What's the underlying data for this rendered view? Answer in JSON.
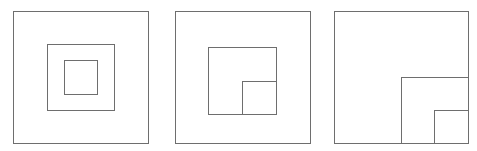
{
  "diagram": {
    "background": "#ffffff",
    "stroke_color": "#6e6e6e",
    "stroke_width": 1,
    "panels": [
      {
        "name": "concentric-squares",
        "squares": [
          {
            "name": "outer-square",
            "x": 13.5,
            "y": 11.5,
            "w": 135,
            "h": 132
          },
          {
            "name": "middle-square",
            "x": 47.5,
            "y": 44.5,
            "w": 67,
            "h": 66
          },
          {
            "name": "inner-square",
            "x": 64.5,
            "y": 60.5,
            "w": 33,
            "h": 34
          }
        ]
      },
      {
        "name": "nested-corner-in-center",
        "squares": [
          {
            "name": "outer-square",
            "x": 175.5,
            "y": 11.5,
            "w": 135,
            "h": 132
          },
          {
            "name": "middle-square",
            "x": 208.5,
            "y": 47.5,
            "w": 68,
            "h": 67
          },
          {
            "name": "inner-square",
            "x": 242.5,
            "y": 81.5,
            "w": 34,
            "h": 33
          }
        ]
      },
      {
        "name": "nested-corner-bottom-right",
        "squares": [
          {
            "name": "outer-square",
            "x": 334.5,
            "y": 11.5,
            "w": 134,
            "h": 132
          },
          {
            "name": "middle-square",
            "x": 401.5,
            "y": 77.5,
            "w": 67,
            "h": 66
          },
          {
            "name": "inner-square",
            "x": 434.5,
            "y": 110.5,
            "w": 34,
            "h": 33
          }
        ]
      }
    ]
  }
}
